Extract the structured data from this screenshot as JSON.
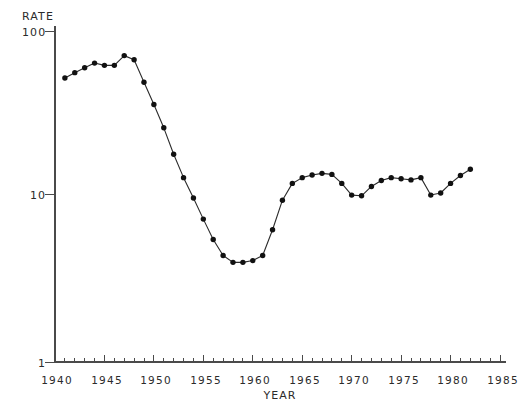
{
  "chart_data": {
    "type": "line",
    "title": "",
    "xlabel": "YEAR",
    "ylabel": "RATE",
    "yscale": "log",
    "ylim": [
      1,
      100
    ],
    "xlim": [
      1940,
      1985
    ],
    "grid": false,
    "legend": null,
    "ytick_labels": [
      "100",
      "10",
      "1"
    ],
    "ytick_values": [
      100,
      10,
      1
    ],
    "xtick_labels": [
      "1940",
      "1945",
      "1950",
      "1955",
      "1960",
      "1965",
      "1970",
      "1975",
      "1980",
      "1985"
    ],
    "xtick_values": [
      1940,
      1945,
      1950,
      1955,
      1960,
      1965,
      1970,
      1975,
      1980,
      1985
    ],
    "x_minor_tick_step": 1,
    "marker": "filled-circle",
    "series": [
      {
        "name": "rate",
        "x": [
          1941,
          1942,
          1943,
          1944,
          1945,
          1946,
          1947,
          1948,
          1949,
          1950,
          1951,
          1952,
          1953,
          1954,
          1955,
          1956,
          1957,
          1958,
          1959,
          1960,
          1961,
          1962,
          1963,
          1964,
          1965,
          1966,
          1967,
          1968,
          1969,
          1970,
          1971,
          1972,
          1973,
          1974,
          1975,
          1976,
          1977,
          1978,
          1979,
          1980,
          1981,
          1982
        ],
        "values": [
          52.0,
          56.0,
          60.0,
          64.0,
          62.0,
          62.0,
          71.0,
          67.0,
          49.0,
          36.0,
          26.0,
          18.0,
          13.0,
          9.8,
          7.3,
          5.5,
          4.4,
          4.0,
          4.0,
          4.1,
          4.4,
          6.3,
          9.5,
          12.0,
          13.0,
          13.5,
          13.8,
          13.6,
          12.0,
          10.2,
          10.1,
          11.5,
          12.5,
          13.0,
          12.8,
          12.6,
          13.0,
          10.2,
          10.5,
          12.0,
          13.4,
          14.6
        ]
      }
    ]
  },
  "axes": {
    "ylabel": "RATE",
    "xlabel": "YEAR",
    "ytick_100": "100",
    "ytick_10": "10",
    "ytick_1": "1",
    "xtick_1940": "1940",
    "xtick_1945": "1945",
    "xtick_1950": "1950",
    "xtick_1955": "1955",
    "xtick_1960": "1960",
    "xtick_1965": "1965",
    "xtick_1970": "1970",
    "xtick_1975": "1975",
    "xtick_1980": "1980",
    "xtick_1985": "1985"
  },
  "caption": {
    "text": ""
  }
}
